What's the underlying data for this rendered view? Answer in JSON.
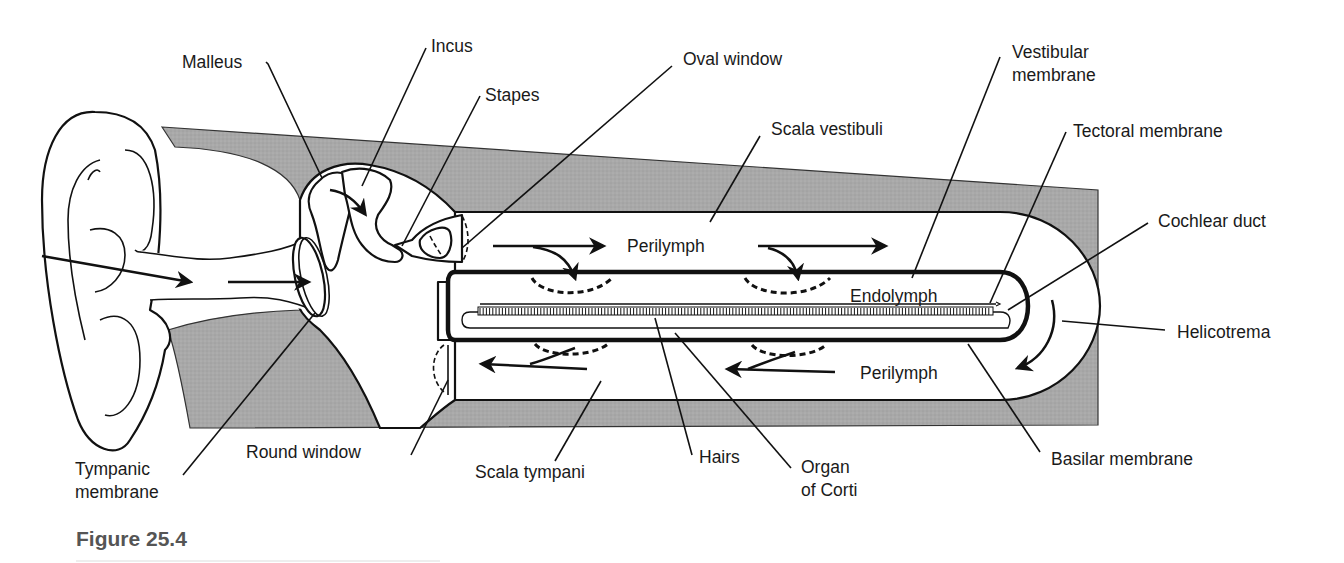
{
  "figure": {
    "caption": "Figure 25.4",
    "colors": {
      "bone_tissue": "#a9a9a9",
      "line": "#111111",
      "caption_text": "#555555",
      "background": "#ffffff"
    }
  },
  "labels": {
    "malleus": "Malleus",
    "incus": "Incus",
    "stapes": "Stapes",
    "oval_window": "Oval window",
    "vestibular_membrane_1": "Vestibular",
    "vestibular_membrane_2": "membrane",
    "scala_vestibuli": "Scala vestibuli",
    "tectoral_membrane": "Tectoral membrane",
    "cochlear_duct": "Cochlear duct",
    "helicotrema": "Helicotrema",
    "basilar_membrane": "Basilar membrane",
    "organ_of_corti_1": "Organ",
    "organ_of_corti_2": "of Corti",
    "hairs": "Hairs",
    "scala_tympani": "Scala tympani",
    "round_window": "Round window",
    "tympanic_membrane_1": "Tympanic",
    "tympanic_membrane_2": "membrane"
  },
  "inner_labels": {
    "perilymph_upper": "Perilymph",
    "endolymph": "Endolymph",
    "perilymph_lower": "Perilymph"
  }
}
